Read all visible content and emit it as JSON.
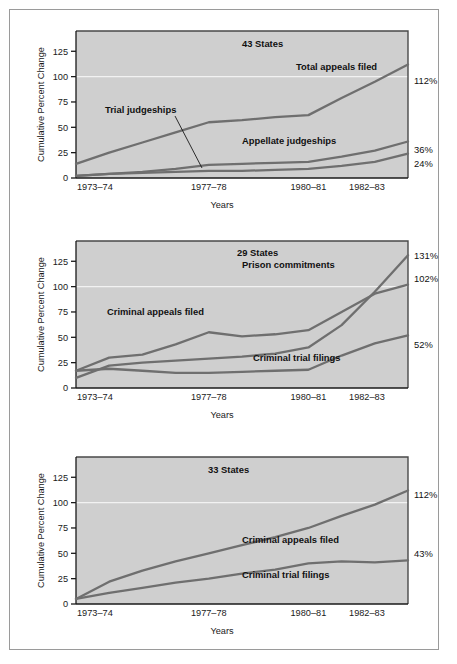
{
  "figure": {
    "background_color": "#ffffff",
    "frame_border_color": "#9a9a9a",
    "plot_background_color": "#cfcfcf",
    "line_color": "#6f6f6f"
  },
  "axis": {
    "ylabel": "Cumulative Percent Change",
    "xlabel": "Years",
    "yticks": [
      "0",
      "25",
      "50",
      "75",
      "100",
      "125"
    ],
    "ytick_values": [
      0,
      25,
      50,
      75,
      100,
      125
    ],
    "ylim": [
      0,
      145
    ],
    "xticks": [
      "1973–74",
      "1977–78",
      "1980–81",
      "1982–83"
    ],
    "xtick_positions": [
      0,
      4,
      7,
      9
    ],
    "xlim": [
      0,
      10
    ]
  },
  "chart_data": [
    {
      "type": "line",
      "panel": 1,
      "title": "43 States",
      "xlabel": "Years",
      "ylabel": "Cumulative Percent Change",
      "ylim": [
        0,
        145
      ],
      "categories": [
        "1973–74",
        "1977–78",
        "1980–81",
        "1982–83"
      ],
      "grid": false,
      "legend": "inline-annotations",
      "series": [
        {
          "name": "Total appeals filed",
          "end_label": "112%",
          "x": [
            0,
            1,
            2,
            3,
            4,
            5,
            6,
            7,
            8,
            9,
            10
          ],
          "values": [
            14,
            25,
            35,
            45,
            55,
            57,
            60,
            62,
            79,
            95,
            112
          ]
        },
        {
          "name": "Appellate judgeships",
          "end_label": "36%",
          "x": [
            0,
            1,
            2,
            3,
            4,
            5,
            6,
            7,
            8,
            9,
            10
          ],
          "values": [
            2,
            4,
            6,
            9,
            13,
            14,
            15,
            16,
            21,
            27,
            36
          ]
        },
        {
          "name": "Trial judgeships",
          "end_label": "24%",
          "x": [
            0,
            1,
            2,
            3,
            4,
            5,
            6,
            7,
            8,
            9,
            10
          ],
          "values": [
            2,
            4,
            5,
            6,
            7,
            7,
            8,
            9,
            12,
            16,
            24
          ]
        }
      ]
    },
    {
      "type": "line",
      "panel": 2,
      "title": "29 States",
      "xlabel": "Years",
      "ylabel": "Cumulative Percent Change",
      "ylim": [
        0,
        145
      ],
      "categories": [
        "1973–74",
        "1977–78",
        "1980–81",
        "1982–83"
      ],
      "grid": false,
      "legend": "inline-annotations",
      "series": [
        {
          "name": "Prison commitments",
          "end_label": "131%",
          "x": [
            0,
            1,
            2,
            3,
            4,
            5,
            6,
            7,
            8,
            9,
            10
          ],
          "values": [
            10,
            22,
            25,
            27,
            29,
            31,
            34,
            40,
            62,
            95,
            131
          ]
        },
        {
          "name": "Criminal appeals filed",
          "end_label": "102%",
          "x": [
            0,
            1,
            2,
            3,
            4,
            5,
            6,
            7,
            8,
            9,
            10
          ],
          "values": [
            17,
            30,
            33,
            43,
            55,
            51,
            53,
            57,
            75,
            93,
            102
          ]
        },
        {
          "name": "Criminal trial filings",
          "end_label": "52%",
          "x": [
            0,
            1,
            2,
            3,
            4,
            5,
            6,
            7,
            8,
            9,
            10
          ],
          "values": [
            17,
            19,
            17,
            15,
            15,
            16,
            17,
            18,
            32,
            44,
            52
          ]
        }
      ]
    },
    {
      "type": "line",
      "panel": 3,
      "title": "33 States",
      "xlabel": "Years",
      "ylabel": "Cumulative Percent Change",
      "ylim": [
        0,
        145
      ],
      "categories": [
        "1973–74",
        "1977–78",
        "1980–81",
        "1982–83"
      ],
      "grid": false,
      "legend": "inline-annotations",
      "series": [
        {
          "name": "Criminal appeals filed",
          "end_label": "112%",
          "x": [
            0,
            1,
            2,
            3,
            4,
            5,
            6,
            7,
            8,
            9,
            10
          ],
          "values": [
            5,
            22,
            33,
            42,
            50,
            58,
            66,
            75,
            87,
            98,
            112
          ]
        },
        {
          "name": "Criminal trial filings",
          "end_label": "43%",
          "x": [
            0,
            1,
            2,
            3,
            4,
            5,
            6,
            7,
            8,
            9,
            10
          ],
          "values": [
            5,
            11,
            16,
            21,
            25,
            30,
            34,
            40,
            42,
            41,
            43
          ]
        }
      ]
    }
  ]
}
